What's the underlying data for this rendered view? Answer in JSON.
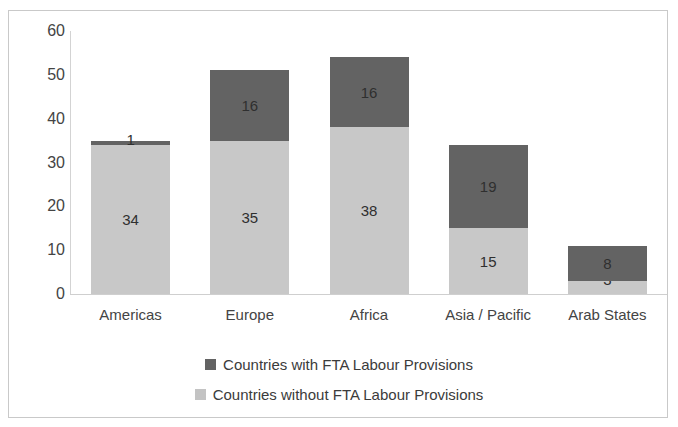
{
  "clipped_header_text": "",
  "chart_data": {
    "type": "bar",
    "subtype": "stacked-vertical",
    "title": "",
    "xlabel": "",
    "ylabel": "",
    "ylim": [
      0,
      60
    ],
    "yticks": [
      0,
      10,
      20,
      30,
      40,
      50,
      60
    ],
    "ytick_labels": [
      "0",
      "10",
      "20",
      "30",
      "40",
      "50",
      "60"
    ],
    "grid": false,
    "legend_position": "bottom",
    "categories": [
      "Americas",
      "Europe",
      "Africa",
      "Asia / Pacific",
      "Arab States"
    ],
    "series": [
      {
        "name": "Countries without FTA Labour Provisions",
        "color": "#c8c8c8",
        "values": [
          34,
          35,
          38,
          15,
          3
        ]
      },
      {
        "name": "Countries with FTA Labour Provisions",
        "color": "#636363",
        "values": [
          1,
          16,
          16,
          19,
          8
        ]
      }
    ],
    "totals": [
      35,
      51,
      54,
      34,
      11
    ],
    "stack_order": [
      "Countries without FTA Labour Provisions",
      "Countries with FTA Labour Provisions"
    ]
  },
  "legend": {
    "items": [
      {
        "label": "Countries with FTA Labour Provisions",
        "swatch": "dark-gray-square"
      },
      {
        "label": "Countries without FTA Labour Provisions",
        "swatch": "light-gray-square"
      }
    ]
  },
  "colors": {
    "with_provisions": "#636363",
    "without_provisions": "#c8c8c8",
    "axis": "#cfcfcf",
    "text": "#3d3d3d",
    "frame_border": "#c9c9c9"
  }
}
